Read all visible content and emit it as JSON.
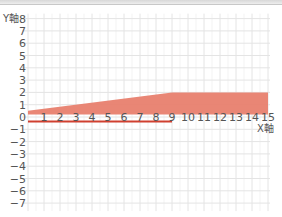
{
  "chart_data": {
    "type": "area",
    "title": "",
    "xlabel": "X軸",
    "ylabel": "Y軸",
    "xlim": [
      0,
      15
    ],
    "ylim": [
      -7,
      8
    ],
    "x_ticks": [
      "0",
      "1",
      "2",
      "3",
      "4",
      "5",
      "6",
      "7",
      "8",
      "9",
      "10",
      "11",
      "12",
      "13",
      "14",
      "15"
    ],
    "y_ticks": [
      "8",
      "7",
      "6",
      "5",
      "4",
      "3",
      "2",
      "1",
      "0",
      "−1",
      "−2",
      "−3",
      "−4",
      "−5",
      "−6",
      "−7"
    ],
    "grid": true,
    "series": [
      {
        "name": "shaded-region",
        "kind": "area",
        "color": "#e8806e",
        "upper": {
          "x": [
            0,
            9,
            15
          ],
          "y": [
            0.5,
            2,
            2
          ]
        },
        "lower": {
          "x": [
            0,
            15
          ],
          "y": [
            0.2,
            0.2
          ]
        }
      },
      {
        "name": "segment",
        "kind": "line",
        "color": "#d04030",
        "x": [
          0,
          9
        ],
        "y": [
          -0.2,
          -0.2
        ]
      }
    ]
  },
  "labels": {
    "x_axis": "X軸",
    "y_axis": "Y軸"
  }
}
